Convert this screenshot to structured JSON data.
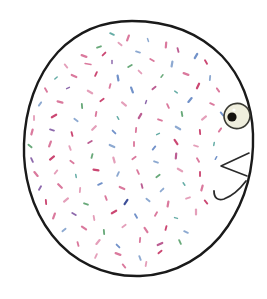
{
  "image": {
    "title": "Hand-drawn speckled round bird",
    "description": "A large hand-drawn rounded oval body filled with many small multicolored dashes, with a single eye and a small triangular beak on the right side",
    "width": 267,
    "height": 299,
    "background_color": "#ffffff",
    "medium": "ink line drawing with colored pencil speckles"
  },
  "palette": {
    "outline": "#1a1a1a",
    "body_fill": "#ffffff",
    "eye_outline": "#3a3a33",
    "eye_iris": "#efeedd",
    "eye_pupil": "#14120e",
    "speckle_pink": "#d4628c",
    "speckle_crimson": "#c2275a",
    "speckle_magenta": "#b0417f",
    "speckle_rose": "#e08fae",
    "speckle_blue": "#5a7fc0",
    "speckle_steel": "#7a9bc9",
    "speckle_navy": "#1b2f86",
    "speckle_green": "#4f9b63",
    "speckle_teal": "#4a9e96",
    "speckle_purple": "#7a4f9e",
    "speckle_olive": "#8a9a4a"
  },
  "body": {
    "label": "bird-body",
    "outline_width": 2.4,
    "path": "M 132 21 C 170 21 200 34 222 56 C 241 76 252 104 253 134 C 254 166 246 199 228 226 C 208 256 175 275 140 276 C 104 277 72 261 52 235 C 31 208 23 174 24 144 C 25 110 36 76 58 52 C 78 31 104 21 132 21 Z"
  },
  "eye": {
    "label": "bird-eye",
    "cx": 237,
    "cy": 116,
    "rx": 13,
    "ry": 12.5,
    "rotation": -18,
    "pupil": {
      "cx": 232,
      "cy": 117,
      "r": 4.6
    },
    "highlight": {
      "cx": 234,
      "cy": 110,
      "r": 1.6
    }
  },
  "beak": {
    "label": "bird-beak",
    "path": "M 249 153 L 221 166 L 247 176"
  },
  "chin_stroke": {
    "label": "bird-chin-stroke",
    "path": "M 214 191 C 214 198 218 201 224 199 C 232 196 240 189 246 181"
  },
  "speckles": {
    "count": 236,
    "shape": "short-dash",
    "length_range": [
      2,
      7
    ],
    "colors": [
      "#d4628c",
      "#c2275a",
      "#b0417f",
      "#e08fae",
      "#5a7fc0",
      "#7a9bc9",
      "#1b2f86",
      "#4f9b63",
      "#4a9e96",
      "#7a4f9e",
      "#8a9a4a"
    ],
    "marks": [
      [
        112,
        34,
        "#4a9e96",
        4,
        25
      ],
      [
        128,
        38,
        "#d4628c",
        5,
        110
      ],
      [
        148,
        40,
        "#7a9bc9",
        3,
        70
      ],
      [
        99,
        47,
        "#4f9b63",
        4,
        160
      ],
      [
        120,
        44,
        "#e08fae",
        4,
        40
      ],
      [
        166,
        45,
        "#d4628c",
        5,
        95
      ],
      [
        84,
        56,
        "#d4628c",
        5,
        20
      ],
      [
        104,
        54,
        "#c2275a",
        4,
        135
      ],
      [
        138,
        52,
        "#7a9bc9",
        4,
        15
      ],
      [
        178,
        50,
        "#b0417f",
        4,
        75
      ],
      [
        196,
        56,
        "#5a7fc0",
        5,
        120
      ],
      [
        66,
        66,
        "#e08fae",
        4,
        50
      ],
      [
        88,
        64,
        "#d4628c",
        6,
        10
      ],
      [
        112,
        62,
        "#7a4f9e",
        3,
        90
      ],
      [
        130,
        66,
        "#4f9b63",
        4,
        150
      ],
      [
        152,
        60,
        "#d4628c",
        4,
        30
      ],
      [
        172,
        64,
        "#7a9bc9",
        5,
        100
      ],
      [
        206,
        62,
        "#c2275a",
        4,
        60
      ],
      [
        56,
        78,
        "#4a9e96",
        3,
        140
      ],
      [
        74,
        76,
        "#d4628c",
        5,
        25
      ],
      [
        96,
        74,
        "#c2275a",
        4,
        115
      ],
      [
        118,
        78,
        "#5a7fc0",
        5,
        80
      ],
      [
        140,
        72,
        "#e08fae",
        4,
        45
      ],
      [
        162,
        76,
        "#4f9b63",
        3,
        130
      ],
      [
        186,
        74,
        "#d4628c",
        5,
        20
      ],
      [
        210,
        78,
        "#7a9bc9",
        4,
        95
      ],
      [
        46,
        90,
        "#d4628c",
        4,
        60
      ],
      [
        68,
        88,
        "#7a4f9e",
        3,
        155
      ],
      [
        90,
        92,
        "#e08fae",
        5,
        30
      ],
      [
        110,
        86,
        "#d4628c",
        4,
        105
      ],
      [
        132,
        90,
        "#5a7fc0",
        5,
        70
      ],
      [
        154,
        88,
        "#b0417f",
        4,
        140
      ],
      [
        176,
        92,
        "#4a9e96",
        3,
        35
      ],
      [
        198,
        86,
        "#c2275a",
        5,
        115
      ],
      [
        218,
        90,
        "#d4628c",
        4,
        55
      ],
      [
        40,
        104,
        "#7a9bc9",
        4,
        125
      ],
      [
        60,
        102,
        "#d4628c",
        5,
        15
      ],
      [
        82,
        106,
        "#4f9b63",
        4,
        85
      ],
      [
        102,
        100,
        "#c2275a",
        4,
        145
      ],
      [
        124,
        104,
        "#e08fae",
        5,
        40
      ],
      [
        146,
        102,
        "#7a4f9e",
        3,
        110
      ],
      [
        168,
        106,
        "#d4628c",
        4,
        65
      ],
      [
        190,
        100,
        "#5a7fc0",
        5,
        130
      ],
      [
        212,
        104,
        "#d4628c",
        4,
        25
      ],
      [
        34,
        118,
        "#e08fae",
        4,
        90
      ],
      [
        54,
        116,
        "#c2275a",
        5,
        150
      ],
      [
        76,
        120,
        "#7a9bc9",
        4,
        35
      ],
      [
        96,
        114,
        "#d4628c",
        4,
        100
      ],
      [
        118,
        118,
        "#4a9e96",
        3,
        60
      ],
      [
        140,
        116,
        "#b0417f",
        5,
        120
      ],
      [
        160,
        120,
        "#d4628c",
        4,
        20
      ],
      [
        182,
        114,
        "#4f9b63",
        4,
        80
      ],
      [
        204,
        118,
        "#e08fae",
        5,
        140
      ],
      [
        222,
        114,
        "#5a7fc0",
        4,
        50
      ],
      [
        32,
        132,
        "#d4628c",
        5,
        105
      ],
      [
        52,
        130,
        "#7a4f9e",
        4,
        15
      ],
      [
        72,
        134,
        "#c2275a",
        4,
        75
      ],
      [
        94,
        128,
        "#e08fae",
        5,
        135
      ],
      [
        114,
        132,
        "#5a7fc0",
        4,
        45
      ],
      [
        136,
        130,
        "#d4628c",
        4,
        95
      ],
      [
        158,
        134,
        "#4a9e96",
        3,
        155
      ],
      [
        178,
        128,
        "#7a9bc9",
        5,
        30
      ],
      [
        200,
        132,
        "#c2275a",
        4,
        85
      ],
      [
        220,
        130,
        "#d4628c",
        4,
        125
      ],
      [
        30,
        146,
        "#4f9b63",
        4,
        40
      ],
      [
        50,
        144,
        "#d4628c",
        5,
        110
      ],
      [
        70,
        148,
        "#e08fae",
        4,
        70
      ],
      [
        90,
        142,
        "#b0417f",
        4,
        150
      ],
      [
        112,
        146,
        "#7a9bc9",
        5,
        25
      ],
      [
        134,
        144,
        "#d4628c",
        4,
        90
      ],
      [
        154,
        148,
        "#5a7fc0",
        4,
        130
      ],
      [
        176,
        142,
        "#c2275a",
        5,
        55
      ],
      [
        196,
        146,
        "#e08fae",
        4,
        15
      ],
      [
        214,
        144,
        "#4a9e96",
        3,
        100
      ],
      [
        32,
        160,
        "#7a4f9e",
        4,
        65
      ],
      [
        52,
        158,
        "#c2275a",
        5,
        140
      ],
      [
        72,
        162,
        "#d4628c",
        4,
        35
      ],
      [
        92,
        156,
        "#4f9b63",
        4,
        105
      ],
      [
        114,
        160,
        "#e08fae",
        5,
        75
      ],
      [
        134,
        158,
        "#d4628c",
        4,
        145
      ],
      [
        156,
        162,
        "#7a9bc9",
        4,
        20
      ],
      [
        176,
        156,
        "#b0417f",
        5,
        95
      ],
      [
        198,
        160,
        "#d4628c",
        4,
        60
      ],
      [
        216,
        158,
        "#5a7fc0",
        3,
        120
      ],
      [
        36,
        174,
        "#d4628c",
        5,
        50
      ],
      [
        56,
        172,
        "#e08fae",
        4,
        130
      ],
      [
        76,
        176,
        "#4a9e96",
        3,
        80
      ],
      [
        96,
        170,
        "#c2275a",
        5,
        10
      ],
      [
        118,
        174,
        "#7a9bc9",
        4,
        115
      ],
      [
        138,
        172,
        "#d4628c",
        4,
        65
      ],
      [
        158,
        176,
        "#4f9b63",
        4,
        145
      ],
      [
        180,
        170,
        "#e08fae",
        5,
        30
      ],
      [
        200,
        174,
        "#c2275a",
        4,
        90
      ],
      [
        40,
        188,
        "#7a4f9e",
        4,
        120
      ],
      [
        60,
        186,
        "#d4628c",
        5,
        45
      ],
      [
        80,
        190,
        "#e08fae",
        4,
        95
      ],
      [
        100,
        184,
        "#5a7fc0",
        4,
        155
      ],
      [
        122,
        188,
        "#d4628c",
        5,
        25
      ],
      [
        142,
        186,
        "#b0417f",
        4,
        75
      ],
      [
        162,
        190,
        "#7a9bc9",
        4,
        135
      ],
      [
        184,
        184,
        "#4a9e96",
        3,
        55
      ],
      [
        202,
        188,
        "#d4628c",
        5,
        105
      ],
      [
        46,
        202,
        "#c2275a",
        4,
        85
      ],
      [
        66,
        200,
        "#e08fae",
        5,
        140
      ],
      [
        86,
        204,
        "#4f9b63",
        4,
        20
      ],
      [
        106,
        198,
        "#d4628c",
        4,
        70
      ],
      [
        126,
        202,
        "#1b2f86",
        5,
        125
      ],
      [
        148,
        200,
        "#7a9bc9",
        4,
        40
      ],
      [
        168,
        204,
        "#d4628c",
        5,
        100
      ],
      [
        188,
        198,
        "#e08fae",
        4,
        160
      ],
      [
        206,
        202,
        "#c2275a",
        4,
        50
      ],
      [
        54,
        216,
        "#d4628c",
        5,
        110
      ],
      [
        74,
        214,
        "#7a4f9e",
        4,
        30
      ],
      [
        94,
        218,
        "#e08fae",
        4,
        80
      ],
      [
        114,
        212,
        "#c2275a",
        5,
        150
      ],
      [
        136,
        216,
        "#5a7fc0",
        4,
        60
      ],
      [
        156,
        214,
        "#d4628c",
        4,
        120
      ],
      [
        176,
        218,
        "#4a9e96",
        3,
        15
      ],
      [
        196,
        212,
        "#e08fae",
        5,
        90
      ],
      [
        64,
        230,
        "#7a9bc9",
        4,
        140
      ],
      [
        84,
        228,
        "#d4628c",
        5,
        35
      ],
      [
        104,
        232,
        "#4f9b63",
        4,
        85
      ],
      [
        124,
        226,
        "#e08fae",
        4,
        145
      ],
      [
        146,
        230,
        "#d4628c",
        5,
        55
      ],
      [
        166,
        228,
        "#c2275a",
        4,
        105
      ],
      [
        186,
        232,
        "#7a9bc9",
        4,
        25
      ],
      [
        78,
        244,
        "#d4628c",
        4,
        75
      ],
      [
        98,
        242,
        "#e08fae",
        5,
        130
      ],
      [
        118,
        246,
        "#5a7fc0",
        4,
        45
      ],
      [
        140,
        240,
        "#d4628c",
        4,
        95
      ],
      [
        160,
        244,
        "#b0417f",
        5,
        155
      ],
      [
        180,
        242,
        "#4f9b63",
        4,
        65
      ],
      [
        96,
        256,
        "#e08fae",
        4,
        115
      ],
      [
        118,
        254,
        "#d4628c",
        5,
        20
      ],
      [
        140,
        258,
        "#7a9bc9",
        4,
        70
      ],
      [
        160,
        252,
        "#c2275a",
        4,
        140
      ],
      [
        124,
        266,
        "#d4628c",
        4,
        50
      ],
      [
        146,
        264,
        "#e08fae",
        4,
        100
      ]
    ]
  }
}
